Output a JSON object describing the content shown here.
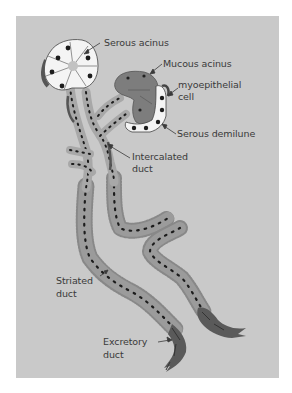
{
  "figure": {
    "labels": {
      "serous_acinus": "Serous acinus",
      "mucous_acinus": "Mucous acinus",
      "myoepithelial_1": "myoepithelial",
      "myoepithelial_2": "cell",
      "serous_demilune": "Serous demilune",
      "intercalated_1": "Intercalated",
      "intercalated_2": "duct",
      "striated_1": "Striated",
      "striated_2": "duct",
      "excretory_1": "Excretory",
      "excretory_2": "duct"
    },
    "colors": {
      "background": "#c9c9c9",
      "serous_cell": "#f4f4f4",
      "mucous_cell": "#7d7d7d",
      "duct_light": "#a6a6a6",
      "duct_striated": "#979797",
      "excretory": "#5a5a5a",
      "nucleus": "#1c1c1c",
      "text": "#3a3a3a"
    }
  }
}
